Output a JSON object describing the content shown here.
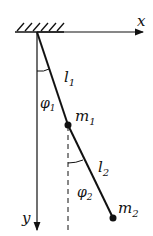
{
  "diagram": {
    "axes": {
      "x_label": "x",
      "y_label": "y"
    },
    "rods": [
      {
        "label": "l",
        "sub": "1"
      },
      {
        "label": "l",
        "sub": "2"
      }
    ],
    "masses": [
      {
        "label": "m",
        "sub": "1"
      },
      {
        "label": "m",
        "sub": "2"
      }
    ],
    "angles": [
      {
        "label": "φ",
        "sub": "1"
      },
      {
        "label": "φ",
        "sub": "2"
      }
    ],
    "colors": {
      "ink": "#111111",
      "background": "#ffffff"
    }
  }
}
